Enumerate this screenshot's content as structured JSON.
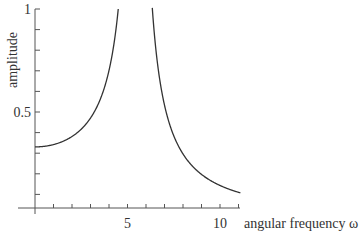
{
  "chart_data": {
    "type": "line",
    "title": "",
    "xlabel": "angular frequency ω",
    "ylabel": "amplitude",
    "x_ticks": [
      {
        "value": 5,
        "label": "5"
      },
      {
        "value": 10,
        "label": "10"
      }
    ],
    "y_ticks": [
      {
        "value": 0.5,
        "label": "0.5"
      },
      {
        "value": 1,
        "label": "1"
      }
    ],
    "xlim": [
      0,
      12
    ],
    "ylim": [
      0,
      1
    ],
    "grid": false,
    "series": [
      {
        "name": "amplitude response",
        "formula": "A(ω) = 10 / |30.25 − ω²|",
        "points": [
          [
            0,
            0.33
          ],
          [
            1,
            0.34
          ],
          [
            2,
            0.38
          ],
          [
            3,
            0.47
          ],
          [
            3.5,
            0.55
          ],
          [
            4,
            0.7
          ],
          [
            4.5,
            1.0
          ],
          [
            6.3,
            1.0
          ],
          [
            7,
            0.53
          ],
          [
            8,
            0.3
          ],
          [
            9,
            0.2
          ],
          [
            10,
            0.14
          ],
          [
            11,
            0.11
          ]
        ]
      }
    ]
  }
}
